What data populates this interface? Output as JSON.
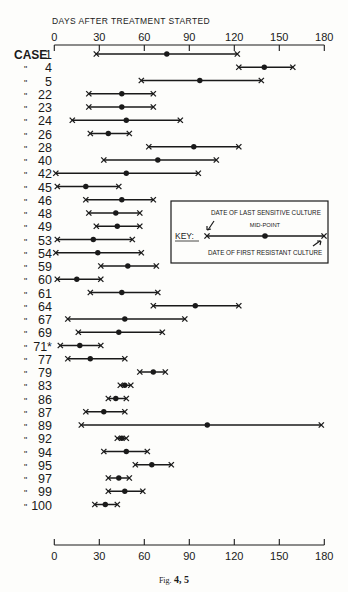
{
  "chart_data": {
    "type": "range-dot",
    "title": "",
    "xlabel": "DAYS AFTER TREATMENT STARTED",
    "ylabel": "CASE",
    "xlim": [
      0,
      180
    ],
    "xticks": [
      0,
      30,
      60,
      90,
      120,
      150,
      180
    ],
    "grid": false,
    "categories": [
      "1",
      "4",
      "5",
      "22",
      "23",
      "24",
      "26",
      "28",
      "40",
      "42",
      "45",
      "46",
      "48",
      "49",
      "53",
      "54",
      "59",
      "60",
      "61",
      "64",
      "67",
      "69",
      "71*",
      "77",
      "79",
      "83",
      "86",
      "87",
      "89",
      "92",
      "94",
      "95",
      "97",
      "99",
      "100"
    ],
    "series": [
      {
        "name": "Date of last sensitive culture",
        "values": [
          28,
          123,
          58,
          23,
          23,
          12,
          24,
          63,
          33,
          1,
          2,
          21,
          23,
          28,
          2,
          1,
          31,
          2,
          24,
          66,
          9,
          16,
          4,
          9,
          57,
          44,
          36,
          21,
          18,
          42,
          33,
          54,
          36,
          36,
          27
        ]
      },
      {
        "name": "Mid-point",
        "values": [
          75,
          140,
          97,
          45,
          45,
          48,
          36,
          93,
          69,
          48,
          21,
          45,
          41,
          42,
          26,
          29,
          49,
          15,
          45,
          94,
          47,
          43,
          17,
          24,
          66,
          47,
          41,
          33,
          102,
          45,
          48,
          65,
          43,
          47,
          34
        ]
      },
      {
        "name": "Date of first resistant culture",
        "values": [
          122,
          159,
          138,
          66,
          66,
          84,
          50,
          123,
          108,
          96,
          43,
          66,
          57,
          57,
          52,
          58,
          68,
          31,
          69,
          123,
          87,
          72,
          31,
          47,
          74,
          51,
          48,
          47,
          178,
          48,
          62,
          78,
          50,
          59,
          42
        ]
      }
    ],
    "legend": {
      "title": "KEY:",
      "start_label": "DATE OF LAST SENSITIVE CULTURE",
      "mid_label": "MID-POINT",
      "end_label": "DATE OF FIRST RESISTANT CULTURE",
      "position": "right-middle"
    },
    "caption": "FIG. 4, 5"
  },
  "labels": {
    "axis_title": "DAYS AFTER TREATMENT STARTED",
    "case_prefix": "CASE",
    "ditto": "\"",
    "caption_prefix": "Fig.",
    "caption_nums": "4, 5"
  },
  "colors": {
    "ink": "#1a1a1a",
    "paper": "#fdfdfb"
  }
}
